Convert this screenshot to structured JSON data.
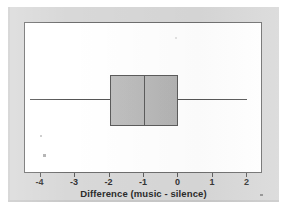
{
  "chart_data": {
    "type": "box",
    "title": "",
    "xlabel": "Difference (music - silence)",
    "ylabel": "",
    "orientation": "horizontal",
    "xlim": [
      -4.45,
      2.45
    ],
    "grid": false,
    "legend": null,
    "xticks": [
      -4,
      -3,
      -2,
      -1,
      0,
      1,
      2
    ],
    "xtick_labels": [
      "-4",
      "-3",
      "-2",
      "-1",
      "0",
      "1",
      "2"
    ],
    "boxes": [
      {
        "name": "Difference (music - silence)",
        "whisker_low": -4.3,
        "q1": -2.0,
        "median": -1.0,
        "q3": 0.0,
        "whisker_high": 2.0,
        "outliers": [],
        "fill_color": "#b9b9b9",
        "line_color": "#5c5c5c"
      }
    ],
    "colors": {
      "box_fill": "#b9b9b9",
      "box_line": "#5c5c5c",
      "whisker": "#555555",
      "frame": "#6e6e6e",
      "plot_background": "#ffffff",
      "figure_background": "#d8d8d8",
      "text": "#2b2b2b"
    }
  },
  "figure": {
    "axis_title": "Difference (music - silence)",
    "ticks": [
      {
        "label": "-4",
        "value": -4
      },
      {
        "label": "-3",
        "value": -3
      },
      {
        "label": "-2",
        "value": -2
      },
      {
        "label": "-1",
        "value": -1
      },
      {
        "label": "0",
        "value": 0
      },
      {
        "label": "1",
        "value": 1
      },
      {
        "label": "2",
        "value": 2
      }
    ]
  }
}
